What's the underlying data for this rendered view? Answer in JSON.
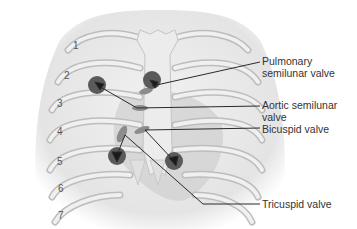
{
  "diagram": {
    "rib_numbers": [
      {
        "label": "1",
        "x": 73,
        "y": 49
      },
      {
        "label": "2",
        "x": 64,
        "y": 79
      },
      {
        "label": "3",
        "x": 57,
        "y": 107
      },
      {
        "label": "4",
        "x": 57,
        "y": 135
      },
      {
        "label": "5",
        "x": 57,
        "y": 165
      },
      {
        "label": "6",
        "x": 58,
        "y": 192
      },
      {
        "label": "7",
        "x": 58,
        "y": 219
      }
    ],
    "labels": [
      {
        "id": "pulmonary",
        "text": "Pulmonary\nsemilunar valve",
        "x": 262,
        "y": 58
      },
      {
        "id": "aortic",
        "text": "Aortic semilunar\nvalve",
        "x": 262,
        "y": 101
      },
      {
        "id": "bicuspid",
        "text": "Bicuspid valve",
        "x": 262,
        "y": 126
      },
      {
        "id": "tricuspid",
        "text": "Tricuspid valve",
        "x": 262,
        "y": 199
      }
    ],
    "colors": {
      "bone": "#e6e6e6",
      "bone_edge": "#bdbdbd",
      "heart_shade": "#9a9a9a",
      "valve_circle": "#5a5a5a",
      "leader_line": "#2a2a2a",
      "label_text": "#333333"
    }
  }
}
